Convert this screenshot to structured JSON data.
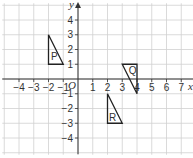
{
  "diagram": {
    "type": "coordinate-grid",
    "x_axis": {
      "label": "x",
      "min": -5,
      "max": 7.8,
      "ticks": [
        -4,
        -3,
        -2,
        -1,
        1,
        2,
        3,
        4,
        5,
        6,
        7
      ]
    },
    "y_axis": {
      "label": "y",
      "min": -5.1,
      "max": 5,
      "ticks": [
        4,
        3,
        2,
        1,
        -1,
        -2,
        -3,
        -4
      ]
    },
    "origin_label": "O",
    "grid_range": {
      "x": [
        -5,
        7
      ],
      "y": [
        -5,
        5
      ]
    },
    "colors": {
      "grid": "#d0d0d0",
      "axis": "#333333",
      "shape": "#222222"
    },
    "shapes": [
      {
        "label": "P",
        "vertices": [
          [
            -2,
            3
          ],
          [
            -2,
            1
          ],
          [
            -1,
            1
          ]
        ],
        "label_at": [
          -1.6,
          1.5
        ]
      },
      {
        "label": "Q",
        "vertices": [
          [
            3,
            1
          ],
          [
            4,
            1
          ],
          [
            4,
            -1
          ]
        ],
        "label_at": [
          3.7,
          0.55
        ]
      },
      {
        "label": "R",
        "vertices": [
          [
            2,
            -1
          ],
          [
            2,
            -3
          ],
          [
            3,
            -3
          ]
        ],
        "label_at": [
          2.35,
          -2.6
        ]
      }
    ]
  }
}
